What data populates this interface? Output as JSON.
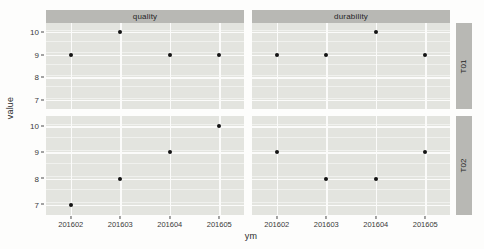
{
  "chart_data": {
    "type": "scatter",
    "title": "",
    "xlabel": "ym",
    "ylabel": "value",
    "categories": [
      "201602",
      "201603",
      "201604",
      "201605"
    ],
    "x": [
      201602,
      201603,
      201604,
      201605
    ],
    "ylim": [
      6.6,
      10.4
    ],
    "yticks": [
      10,
      9,
      8,
      7
    ],
    "ytick_labels": [
      "10",
      "9",
      "8",
      "7"
    ],
    "xtick_labels": [
      "201602",
      "201603",
      "201604",
      "201605"
    ],
    "grid": true,
    "legend": "none",
    "facet_cols": [
      "quality",
      "durability"
    ],
    "facet_rows": [
      "T01",
      "T02"
    ],
    "panels": [
      {
        "col_label": "quality",
        "row_label": "T01",
        "values": [
          9,
          10,
          9,
          9
        ]
      },
      {
        "col_label": "durability",
        "row_label": "T01",
        "values": [
          9,
          9,
          10,
          9
        ]
      },
      {
        "col_label": "quality",
        "row_label": "T02",
        "values": [
          7,
          8,
          9,
          10
        ]
      },
      {
        "col_label": "durability",
        "row_label": "T02",
        "values": [
          9,
          8,
          8,
          9
        ]
      }
    ],
    "colors": {
      "panel_background": "#e3e4df",
      "strip_background": "#b8b8b4",
      "gridline": "#fbfbfa",
      "point": "#141414",
      "text": "#2b2b2b",
      "plot_background": "#fdfdfc"
    }
  }
}
